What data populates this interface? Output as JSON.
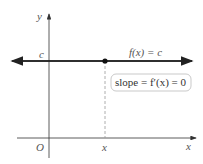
{
  "diagram": {
    "y_axis_label": "y",
    "x_axis_label": "x",
    "origin_label": "O",
    "c_label": "c",
    "x_tick_label": "x",
    "function_label": "f(x) = c",
    "slope_label": "slope = f′(x) = 0",
    "colors": {
      "line": "#222222",
      "axis": "#333333",
      "dashed": "#999999",
      "box_border": "#bbbbbb"
    }
  }
}
